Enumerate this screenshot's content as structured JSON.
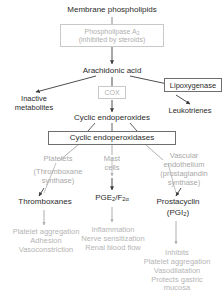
{
  "diagram": {
    "colors": {
      "dark_text": "#2b2b2b",
      "grey_text": "#a9a9a9",
      "grey_box_border": "#c9c9c9",
      "dark_box_border": "#6e6e6e",
      "background": "#ffffff"
    },
    "nodes": {
      "membrane_phospholipids": "Membrane phospholipids",
      "phospholipase_line1": "Phospholipase A",
      "phospholipase_sub": "2",
      "phospholipase_line2": "(inhibited by steroids)",
      "arachidonic_acid": "Arachidonic acid",
      "cox": "COX",
      "inactive_line1": "Inactive",
      "inactive_line2": "metabolites",
      "lipoxygenase": "Lipoxygenase",
      "leukotrienes": "Leukotrienes",
      "cyclic_endoperoxides": "Cyclic endoperoxides",
      "cyclic_endoperoxidases": "Cyclic endoperoxidases",
      "platelets": "Platelets",
      "thromboxane_synthase_line1": "(Thromboxane",
      "thromboxane_synthase_line2": "synthase)",
      "mast_line1": "Mast",
      "mast_line2": "cells",
      "vascular_line1": "Vascular",
      "vascular_line2": "endothelium",
      "vascular_line3": "(prostaglandin",
      "vascular_line4": "synthase)",
      "thromboxanes": "Thromboxanes",
      "pge_prefix": "PGE",
      "pge_sub1": "2",
      "pge_mid": "/F",
      "pge_sub2": "2α",
      "prostacyclin": "Prostacyclin",
      "pgi_prefix": "(PGI",
      "pgi_sub": "2",
      "pgi_suffix": ")",
      "thromboxane_effect_1": "Platelet aggregation",
      "thromboxane_effect_2": "Adhesion",
      "thromboxane_effect_3": "Vasoconstriction",
      "pge_effect_1": "Inflammation",
      "pge_effect_2": "Nerve sensitization",
      "pge_effect_3": "Renal blood flow",
      "pgi_effect_0": "Inhibits",
      "pgi_effect_1": "Platelet aggregation",
      "pgi_effect_2": "Vasodilatation",
      "pgi_effect_3": "Protects gastric",
      "pgi_effect_4": "mucosa"
    }
  }
}
